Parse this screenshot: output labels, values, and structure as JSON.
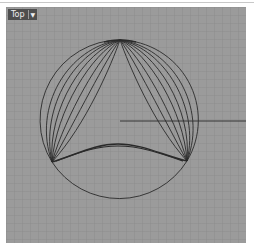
{
  "viewport": {
    "name": "Top",
    "dropdown_icon": "chevron-down-icon",
    "background_color": "#9b9b9b",
    "curve_color": "#2a2a2a"
  },
  "geometry": {
    "circle": {
      "cx": 114,
      "cy": 113,
      "r": 80
    },
    "top_point": [
      114,
      33
    ],
    "left_point": [
      46,
      155
    ],
    "right_point": [
      181,
      154
    ],
    "inner_bottom_arc_peak": [
      112,
      137
    ],
    "radius_line": {
      "x1": 114,
      "y1": 114,
      "x2": 240,
      "y2": 114
    },
    "fan_curves_per_side": 7
  }
}
